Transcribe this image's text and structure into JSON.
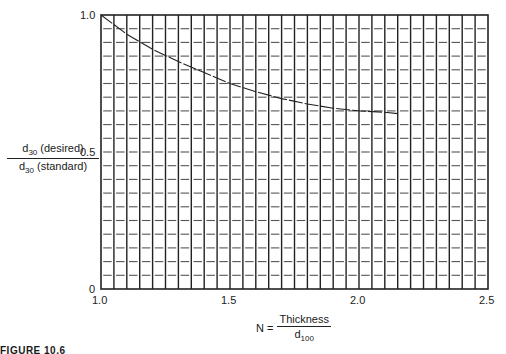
{
  "chart_data": {
    "type": "line",
    "title": "",
    "xlabel": "N = Thickness / d100",
    "ylabel": "d30 (desired) / d30 (standard)",
    "xlim": [
      1.0,
      2.5
    ],
    "ylim": [
      0,
      1.0
    ],
    "x_ticks": [
      "1.0",
      "1.5",
      "2.0",
      "2.5"
    ],
    "y_ticks": [
      "0",
      "0.5",
      "1.0"
    ],
    "grid": {
      "on": true,
      "x_step": 0.05,
      "y_step": 0.05,
      "horizontal_style": "dashed"
    },
    "legend": null,
    "series": [
      {
        "name": "d30 ratio",
        "x": [
          1.0,
          1.1,
          1.2,
          1.3,
          1.4,
          1.5,
          1.6,
          1.7,
          1.8,
          1.9,
          2.0,
          2.1,
          2.15
        ],
        "y": [
          1.0,
          0.93,
          0.875,
          0.83,
          0.79,
          0.75,
          0.72,
          0.695,
          0.675,
          0.66,
          0.65,
          0.645,
          0.64
        ]
      }
    ]
  },
  "axes": {
    "y_ticks": [
      "1.0",
      "0.5",
      "0"
    ],
    "x_ticks": [
      "1.0",
      "1.5",
      "2.0",
      "2.5"
    ]
  },
  "ylabel": {
    "num_main": "d",
    "num_sub": "30",
    "num_rest": " (desired)",
    "den_main": "d",
    "den_sub": "30",
    "den_rest": " (standard)"
  },
  "xlabel": {
    "prefix": "N =",
    "numerator": "Thickness",
    "den_main": "d",
    "den_sub": "100"
  },
  "caption": "FIGURE 10.6"
}
